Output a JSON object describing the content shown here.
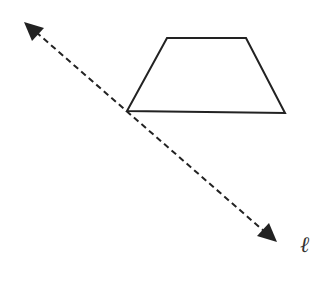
{
  "diagram": {
    "line_label": "ℓ",
    "colors": {
      "stroke": "#222222",
      "background": "#ffffff"
    },
    "trapezoid": {
      "vertices": [
        [
          167,
          38
        ],
        [
          246,
          38
        ],
        [
          285,
          113
        ],
        [
          127,
          111
        ]
      ]
    },
    "line": {
      "start": [
        24,
        22
      ],
      "end": [
        277,
        242
      ],
      "style": "dashed",
      "arrows": "both"
    }
  }
}
